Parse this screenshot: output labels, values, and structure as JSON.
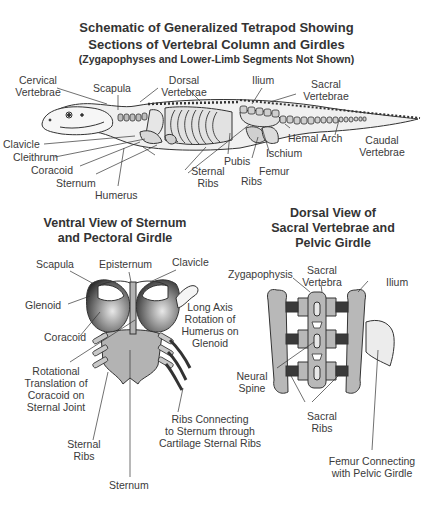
{
  "main_title": {
    "line1": "Schematic of Generalized Tetrapod Showing",
    "line2": "Sections of Vertebral Column and Girdles",
    "line3": "(Zygapophyses and Lower-Limb Segments Not Shown)"
  },
  "tetrapod_labels": {
    "cervical_1": "Cervical",
    "cervical_2": "Vertebrae",
    "scapula": "Scapula",
    "dorsal_1": "Dorsal",
    "dorsal_2": "Vertebrae",
    "ilium": "Ilium",
    "sacral_1": "Sacral",
    "sacral_2": "Vertebrae",
    "clavicle": "Clavicle",
    "cleithrum": "Cleithrum",
    "coracoid": "Coracoid",
    "sternum": "Sternum",
    "humerus": "Humerus",
    "sternal_ribs_1": "Sternal",
    "sternal_ribs_2": "Ribs",
    "ribs": "Ribs",
    "pubis": "Pubis",
    "femur": "Femur",
    "ischium": "Ischium",
    "hemal_arch": "Hemal Arch",
    "caudal_1": "Caudal",
    "caudal_2": "Vertebrae"
  },
  "ventral_view": {
    "title_1": "Ventral View of Sternum",
    "title_2": "and Pectoral Girdle",
    "labels": {
      "scapula": "Scapula",
      "episternum": "Episternum",
      "clavicle": "Clavicle",
      "glenoid": "Glenoid",
      "coracoid": "Coracoid",
      "long_axis_1": "Long Axis",
      "long_axis_2": "Rotation of",
      "long_axis_3": "Humerus on",
      "long_axis_4": "Glenoid",
      "rotational_1": "Rotational",
      "rotational_2": "Translation of",
      "rotational_3": "Coracoid on",
      "rotational_4": "Sternal Joint",
      "sternal_ribs_1": "Sternal",
      "sternal_ribs_2": "Ribs",
      "ribs_conn_1": "Ribs Connecting",
      "ribs_conn_2": "to Sternum through",
      "ribs_conn_3": "Cartilage Sternal Ribs",
      "sternum": "Sternum"
    }
  },
  "dorsal_view": {
    "title_1": "Dorsal View of",
    "title_2": "Sacral Vertebrae and",
    "title_3": "Pelvic Girdle",
    "labels": {
      "zygapophysis": "Zygapophysis",
      "sacral_vertebra_1": "Sacral",
      "sacral_vertebra_2": "Vertebra",
      "ilium": "Ilium",
      "neural_spine_1": "Neural",
      "neural_spine_2": "Spine",
      "sacral_ribs_1": "Sacral",
      "sacral_ribs_2": "Ribs",
      "femur_1": "Femur Connecting",
      "femur_2": "with Pelvic Girdle"
    }
  },
  "colors": {
    "bone_fill": "#d4d4d4",
    "bone_dark": "#9a9a9a",
    "cartilage_dark": "#3a3a3a",
    "outline": "#333333",
    "text": "#3a3a3a"
  }
}
